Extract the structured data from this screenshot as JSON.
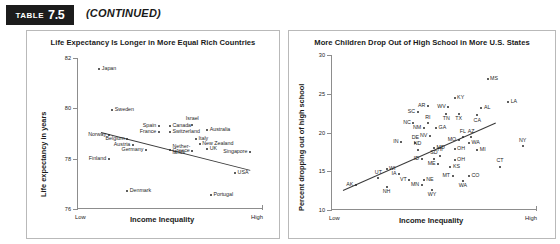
{
  "header": {
    "badge_word": "TABLE",
    "badge_number": "7.5",
    "continued": "(CONTINUED)"
  },
  "chart_data": [
    {
      "id": "left",
      "type": "scatter",
      "title": "Life Expectancy Is Longer in More Equal Rich Countries",
      "xlabel": "Income Inequality",
      "ylabel": "Life expectancy in years",
      "ylim": [
        76,
        82
      ],
      "yticks": [
        "82",
        "80",
        "78",
        "76"
      ],
      "xticks": [
        "Low",
        "High"
      ],
      "grid": false,
      "trendline": true,
      "points": [
        {
          "label": "Japan",
          "x": 0.12,
          "y": 81.55,
          "pos": "w"
        },
        {
          "label": "Sweden",
          "x": 0.19,
          "y": 79.95,
          "pos": "w"
        },
        {
          "label": "Norway",
          "x": 0.17,
          "y": 78.95,
          "pos": "e"
        },
        {
          "label": "Belgium",
          "x": 0.27,
          "y": 78.8,
          "pos": "e"
        },
        {
          "label": "Austria",
          "x": 0.3,
          "y": 78.55,
          "pos": "e"
        },
        {
          "label": "Germany",
          "x": 0.37,
          "y": 78.35,
          "pos": "e"
        },
        {
          "label": "Finland",
          "x": 0.17,
          "y": 78.0,
          "pos": "e"
        },
        {
          "label": "Denmark",
          "x": 0.27,
          "y": 76.7,
          "pos": "w"
        },
        {
          "label": "Spain",
          "x": 0.44,
          "y": 79.3,
          "pos": "e"
        },
        {
          "label": "France",
          "x": 0.44,
          "y": 79.05,
          "pos": "e"
        },
        {
          "label": "Canada",
          "x": 0.5,
          "y": 79.3,
          "pos": "w"
        },
        {
          "label": "Switzerland",
          "x": 0.5,
          "y": 79.05,
          "pos": "w"
        },
        {
          "label": "Israel",
          "x": 0.62,
          "y": 79.35,
          "pos": "n"
        },
        {
          "label": "Australia",
          "x": 0.7,
          "y": 79.15,
          "pos": "w"
        },
        {
          "label": "Nether-\nlands",
          "x": 0.5,
          "y": 78.35,
          "pos": "w"
        },
        {
          "label": "Greece",
          "x": 0.62,
          "y": 78.3,
          "pos": "e"
        },
        {
          "label": "Italy",
          "x": 0.64,
          "y": 78.8,
          "pos": "w"
        },
        {
          "label": "New Zealand",
          "x": 0.66,
          "y": 78.6,
          "pos": "w"
        },
        {
          "label": "UK",
          "x": 0.7,
          "y": 78.4,
          "pos": "w"
        },
        {
          "label": "Singapore",
          "x": 0.93,
          "y": 78.25,
          "pos": "e"
        },
        {
          "label": "USA",
          "x": 0.85,
          "y": 77.45,
          "pos": "w"
        },
        {
          "label": "Portugal",
          "x": 0.72,
          "y": 76.55,
          "pos": "w"
        }
      ]
    },
    {
      "id": "right",
      "type": "scatter",
      "title": "More Children Drop Out of High School in More U.S. States",
      "xlabel": "Income Inequality",
      "ylabel": "Percent dropping out of high school",
      "ylim": [
        10,
        30
      ],
      "yticks": [
        "30",
        "25",
        "20",
        "15",
        "10"
      ],
      "xticks": [
        "Low",
        "High"
      ],
      "grid": false,
      "trendline": true,
      "points": [
        {
          "label": "MS",
          "x": 0.76,
          "y": 26.9,
          "pos": "w"
        },
        {
          "label": "KY",
          "x": 0.6,
          "y": 24.5,
          "pos": "w"
        },
        {
          "label": "LA",
          "x": 0.86,
          "y": 24.0,
          "pos": "w"
        },
        {
          "label": "AR",
          "x": 0.47,
          "y": 23.4,
          "pos": "e"
        },
        {
          "label": "WV",
          "x": 0.57,
          "y": 23.3,
          "pos": "e"
        },
        {
          "label": "AL",
          "x": 0.73,
          "y": 23.2,
          "pos": "w"
        },
        {
          "label": "SC",
          "x": 0.42,
          "y": 22.6,
          "pos": "e"
        },
        {
          "label": "TN",
          "x": 0.56,
          "y": 22.4,
          "pos": "s"
        },
        {
          "label": "TX",
          "x": 0.62,
          "y": 22.4,
          "pos": "s"
        },
        {
          "label": "CA",
          "x": 0.71,
          "y": 22.2,
          "pos": "s"
        },
        {
          "label": "NC",
          "x": 0.4,
          "y": 21.2,
          "pos": "e"
        },
        {
          "label": "RI",
          "x": 0.47,
          "y": 21.2,
          "pos": "n"
        },
        {
          "label": "NM",
          "x": 0.45,
          "y": 20.6,
          "pos": "e"
        },
        {
          "label": "GA",
          "x": 0.51,
          "y": 20.6,
          "pos": "w"
        },
        {
          "label": "FL",
          "x": 0.64,
          "y": 19.4,
          "pos": "n"
        },
        {
          "label": "NY",
          "x": 0.93,
          "y": 18.2,
          "pos": "n"
        },
        {
          "label": "NV",
          "x": 0.48,
          "y": 19.6,
          "pos": "e"
        },
        {
          "label": "AZ",
          "x": 0.68,
          "y": 19.4,
          "pos": "n"
        },
        {
          "label": "MO",
          "x": 0.62,
          "y": 19.0,
          "pos": "e"
        },
        {
          "label": "WA",
          "x": 0.67,
          "y": 18.6,
          "pos": "w"
        },
        {
          "label": "IN",
          "x": 0.34,
          "y": 18.8,
          "pos": "e"
        },
        {
          "label": "DE",
          "x": 0.41,
          "y": 18.6,
          "pos": "n"
        },
        {
          "label": "MD",
          "x": 0.5,
          "y": 18.0,
          "pos": "w"
        },
        {
          "label": "ND",
          "x": 0.42,
          "y": 17.8,
          "pos": "n"
        },
        {
          "label": "OH",
          "x": 0.6,
          "y": 17.9,
          "pos": "w"
        },
        {
          "label": "MI",
          "x": 0.71,
          "y": 17.7,
          "pos": "w"
        },
        {
          "label": "HI",
          "x": 0.53,
          "y": 17.0,
          "pos": "n"
        },
        {
          "label": "ID",
          "x": 0.44,
          "y": 16.6,
          "pos": "e"
        },
        {
          "label": "SD",
          "x": 0.5,
          "y": 16.6,
          "pos": "n"
        },
        {
          "label": "ME",
          "x": 0.52,
          "y": 16.0,
          "pos": "e"
        },
        {
          "label": "OH",
          "x": 0.6,
          "y": 16.4,
          "pos": "w"
        },
        {
          "label": "CT",
          "x": 0.82,
          "y": 15.6,
          "pos": "n"
        },
        {
          "label": "WI",
          "x": 0.27,
          "y": 15.3,
          "pos": "w"
        },
        {
          "label": "KS",
          "x": 0.58,
          "y": 15.6,
          "pos": "w"
        },
        {
          "label": "IA",
          "x": 0.33,
          "y": 14.6,
          "pos": "e"
        },
        {
          "label": "MT",
          "x": 0.59,
          "y": 14.4,
          "pos": "e"
        },
        {
          "label": "CO",
          "x": 0.67,
          "y": 14.4,
          "pos": "w"
        },
        {
          "label": "WA",
          "x": 0.64,
          "y": 13.8,
          "pos": "s"
        },
        {
          "label": "UT",
          "x": 0.23,
          "y": 14.1,
          "pos": "n"
        },
        {
          "label": "VT",
          "x": 0.38,
          "y": 13.9,
          "pos": "e"
        },
        {
          "label": "NE",
          "x": 0.45,
          "y": 13.9,
          "pos": "w"
        },
        {
          "label": "AK",
          "x": 0.12,
          "y": 13.2,
          "pos": "e"
        },
        {
          "label": "NH",
          "x": 0.27,
          "y": 13.0,
          "pos": "s"
        },
        {
          "label": "MN",
          "x": 0.44,
          "y": 13.2,
          "pos": "e"
        },
        {
          "label": "WY",
          "x": 0.49,
          "y": 12.6,
          "pos": "s"
        }
      ]
    }
  ]
}
